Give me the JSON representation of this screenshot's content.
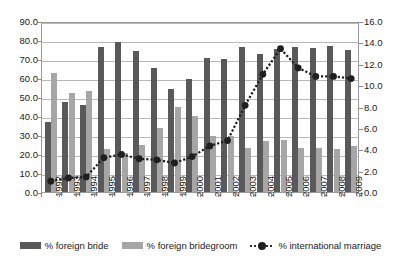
{
  "chart_data": {
    "type": "bar",
    "title": "",
    "xlabel": "",
    "ylabel": "",
    "categories": [
      "1992",
      "1993",
      "1994",
      "1995",
      "1996",
      "1997",
      "1998",
      "1999",
      "2000",
      "2001",
      "2002",
      "2003",
      "2004",
      "2005",
      "2006",
      "2007",
      "2008",
      "2009"
    ],
    "ylim": [
      0,
      90
    ],
    "y2lim": [
      0,
      16
    ],
    "yticks": [
      "0.0",
      "10.0",
      "20.0",
      "30.0",
      "40.0",
      "50.0",
      "60.0",
      "70.0",
      "80.0",
      "90.0"
    ],
    "y2ticks": [
      "0.0",
      "2.0",
      "4.0",
      "6.0",
      "8.0",
      "10.0",
      "12.0",
      "14.0",
      "16.0"
    ],
    "grid": true,
    "legend_position": "bottom",
    "series": [
      {
        "name": "% foreign bride",
        "axis": "left",
        "render": "bar",
        "color": "#595959",
        "values": [
          37.0,
          47.3,
          46.0,
          76.2,
          78.7,
          74.0,
          65.4,
          54.3,
          59.7,
          70.4,
          70.2,
          76.5,
          72.7,
          75.3,
          76.5,
          76.0,
          76.7,
          74.9
        ]
      },
      {
        "name": "% foreign bridegroom",
        "axis": "left",
        "render": "bar",
        "color": "#a6a6a6",
        "values": [
          62.6,
          51.9,
          53.3,
          22.9,
          20.7,
          24.7,
          33.8,
          45.0,
          40.1,
          29.3,
          29.6,
          23.2,
          27.0,
          27.2,
          23.2,
          23.4,
          22.6,
          24.4
        ]
      },
      {
        "name": "% international marriage",
        "axis": "right",
        "render": "line",
        "color": "#1f1f1f",
        "values": [
          1.2,
          1.5,
          1.6,
          3.4,
          3.7,
          3.3,
          3.2,
          2.9,
          3.5,
          4.5,
          5.0,
          8.3,
          11.2,
          13.6,
          11.8,
          11.0,
          11.0,
          10.8
        ]
      }
    ]
  },
  "legend": {
    "items": [
      {
        "label": "% foreign bride",
        "swatch": "bar-dark-swatch"
      },
      {
        "label": "% foreign bridegroom",
        "swatch": "bar-light-swatch"
      },
      {
        "label": "% international marriage",
        "swatch": "line-marker-swatch"
      }
    ]
  }
}
